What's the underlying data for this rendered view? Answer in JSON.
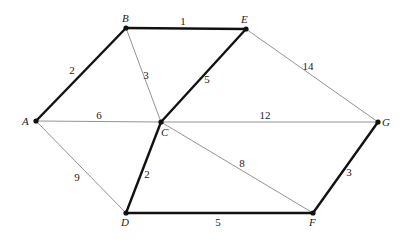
{
  "diagram": {
    "type": "weighted-graph",
    "nodes": [
      {
        "id": "A",
        "label": "A",
        "x": 36,
        "y": 121,
        "lx": 22,
        "ly": 125
      },
      {
        "id": "B",
        "label": "B",
        "x": 126,
        "y": 28,
        "lx": 122,
        "ly": 22
      },
      {
        "id": "E",
        "label": "E",
        "x": 246,
        "y": 29,
        "lx": 241,
        "ly": 23
      },
      {
        "id": "C",
        "label": "C",
        "x": 161,
        "y": 122,
        "lx": 161,
        "ly": 136
      },
      {
        "id": "G",
        "label": "G",
        "x": 378,
        "y": 122,
        "lx": 382,
        "ly": 126
      },
      {
        "id": "D",
        "label": "D",
        "x": 126,
        "y": 213,
        "lx": 121,
        "ly": 226
      },
      {
        "id": "F",
        "label": "F",
        "x": 313,
        "y": 213,
        "lx": 309,
        "ly": 226
      }
    ],
    "edges": [
      {
        "from": "A",
        "to": "B",
        "weight": "2",
        "bold": true,
        "lx": 72,
        "ly": 74
      },
      {
        "from": "B",
        "to": "E",
        "weight": "1",
        "bold": true,
        "lx": 183,
        "ly": 25
      },
      {
        "from": "B",
        "to": "C",
        "weight": "3",
        "bold": false,
        "lx": 146,
        "ly": 79
      },
      {
        "from": "E",
        "to": "C",
        "weight": "5",
        "bold": true,
        "lx": 207,
        "ly": 83
      },
      {
        "from": "E",
        "to": "G",
        "weight": "14",
        "bold": false,
        "lx": 308,
        "ly": 70
      },
      {
        "from": "A",
        "to": "C",
        "weight": "6",
        "bold": false,
        "lx": 99,
        "ly": 119
      },
      {
        "from": "C",
        "to": "G",
        "weight": "12",
        "bold": false,
        "lx": 265,
        "ly": 119
      },
      {
        "from": "A",
        "to": "D",
        "weight": "9",
        "bold": false,
        "lx": 77,
        "ly": 181
      },
      {
        "from": "C",
        "to": "D",
        "weight": "2",
        "bold": true,
        "lx": 147,
        "ly": 178
      },
      {
        "from": "C",
        "to": "F",
        "weight": "8",
        "bold": false,
        "lx": 242,
        "ly": 167
      },
      {
        "from": "D",
        "to": "F",
        "weight": "5",
        "bold": true,
        "lx": 218,
        "ly": 226
      },
      {
        "from": "F",
        "to": "G",
        "weight": "3",
        "bold": true,
        "lx": 349,
        "ly": 176
      }
    ]
  }
}
